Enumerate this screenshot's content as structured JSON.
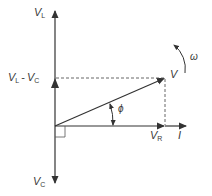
{
  "diagram": {
    "type": "phasor-diagram",
    "colors": {
      "line": "#333333",
      "dashed": "#555555",
      "label": "#3a3a3a",
      "background": "#ffffff"
    },
    "origin": {
      "x": 55,
      "y": 126
    },
    "labels": {
      "vl": {
        "main": "V",
        "sub": "L"
      },
      "vl_minus_vc": {
        "main1": "V",
        "sub1": "L",
        "op": "-",
        "main2": "V",
        "sub2": "C"
      },
      "vc": {
        "main": "V",
        "sub": "C"
      },
      "vr": {
        "main": "V",
        "sub": "R"
      },
      "current": "I",
      "voltage": "V",
      "phase_angle": "ϕ",
      "angular_velocity": "ω"
    },
    "phasors": [
      {
        "name": "V_L",
        "from": [
          55,
          126
        ],
        "to": [
          55,
          10
        ],
        "style": "solid"
      },
      {
        "name": "V_L - V_C",
        "from": [
          55,
          126
        ],
        "to": [
          55,
          78
        ],
        "style": "solid"
      },
      {
        "name": "V_C",
        "from": [
          55,
          126
        ],
        "to": [
          55,
          184
        ],
        "style": "solid"
      },
      {
        "name": "V_R",
        "from": [
          55,
          126
        ],
        "to": [
          165,
          126
        ],
        "style": "solid"
      },
      {
        "name": "I",
        "from": [
          165,
          126
        ],
        "to": [
          187,
          126
        ],
        "style": "solid"
      },
      {
        "name": "V",
        "from": [
          55,
          126
        ],
        "to": [
          165,
          78
        ],
        "style": "solid"
      }
    ],
    "guides": [
      {
        "name": "horizontal-projection",
        "from": [
          55,
          78
        ],
        "to": [
          165,
          78
        ],
        "style": "dashed"
      },
      {
        "name": "vertical-projection",
        "from": [
          165,
          78
        ],
        "to": [
          165,
          126
        ],
        "style": "dashed"
      }
    ]
  }
}
